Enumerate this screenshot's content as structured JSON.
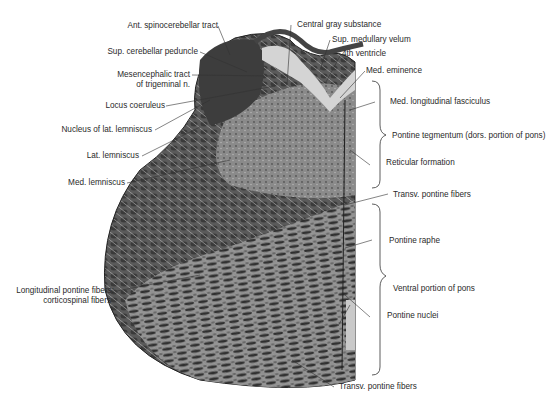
{
  "figure": {
    "labels_left": [
      {
        "id": "ant-spinocerebellar",
        "text": "Ant. spinocerebellar tract"
      },
      {
        "id": "sup-cerebellar-peduncle",
        "text": "Sup. cerebellar peduncle"
      },
      {
        "id": "mesencephalic-tract-1",
        "text": "Mesencephalic tract"
      },
      {
        "id": "mesencephalic-tract-2",
        "text": "of trigeminal n."
      },
      {
        "id": "locus-coeruleus",
        "text": "Locus coeruleus"
      },
      {
        "id": "nucleus-lat-lemniscus",
        "text": "Nucleus of lat. lemniscus"
      },
      {
        "id": "lat-lemniscus",
        "text": "Lat. lemniscus"
      },
      {
        "id": "med-lemniscus",
        "text": "Med. lemniscus"
      },
      {
        "id": "longitudinal-1",
        "text": "Longitudinal pontine fibers:"
      },
      {
        "id": "longitudinal-2",
        "text": "corticospinal fibers"
      }
    ],
    "labels_right": [
      {
        "id": "central-gray",
        "text": "Central gray substance"
      },
      {
        "id": "sup-medullary-velum",
        "text": "Sup. medullary velum"
      },
      {
        "id": "fourth-ventricle",
        "text": "4th ventricle"
      },
      {
        "id": "med-eminence",
        "text": "Med. eminence"
      },
      {
        "id": "mlf",
        "text": "Med. longitudinal fasciculus"
      },
      {
        "id": "pontine-tegmentum",
        "text": "Pontine tegmentum (dors. portion of pons)"
      },
      {
        "id": "reticular-formation",
        "text": "Reticular formation"
      },
      {
        "id": "transv-pontine-1",
        "text": "Transv. pontine fibers"
      },
      {
        "id": "pontine-raphe",
        "text": "Pontine raphe"
      },
      {
        "id": "ventral-pons",
        "text": "Ventral portion of pons"
      },
      {
        "id": "pontine-nuclei",
        "text": "Pontine nuclei"
      },
      {
        "id": "transv-pontine-2",
        "text": "Transv. pontine fibers"
      }
    ],
    "colors": {
      "tissue_dark": "#3c3c3c",
      "tissue_mid": "#6e6e6e",
      "tissue_light": "#c8c8c8",
      "leader": "#333333"
    }
  }
}
